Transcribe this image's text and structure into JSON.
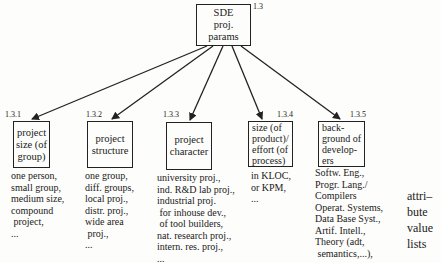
{
  "root": {
    "label": "SDE\nproj.\nparams",
    "number": "1.3"
  },
  "children": [
    {
      "number": "1.3.1",
      "label": "project\nsize (of\ngroup)",
      "values": "one person,\nsmall group,\nmedium size,\ncompound\n project,\n..."
    },
    {
      "number": "1.3.2",
      "label": "project\nstructure",
      "values": "one group,\ndiff. groups,\nlocal proj.,\ndistr. proj.,\nwide area\n proj.,\n..."
    },
    {
      "number": "1.3.3",
      "label": "project\ncharacter",
      "values": "university proj.,\nind. R&D lab proj.,\nindustrial proj.\n for inhouse dev.,\n of tool builders,\nnat. research proj.,\nintern. res. proj.,\n..."
    },
    {
      "number": "1.3.4",
      "label": "size (of\nproduct)/\neffort (of\nprocess)",
      "values": "in KLOC,\nor KPM,\n..."
    },
    {
      "number": "1.3.5",
      "label": "back-\nground of\ndevelop-\ners",
      "values": "Softw. Eng.,\nProgr. Lang./\nCompilers\nOperat. Systems,\nData Base Syst.,\nArtif. Intell.,\nTheory (adt,\n semantics,...),"
    }
  ],
  "legend": "attri–\nbute\nvalue\nlists"
}
